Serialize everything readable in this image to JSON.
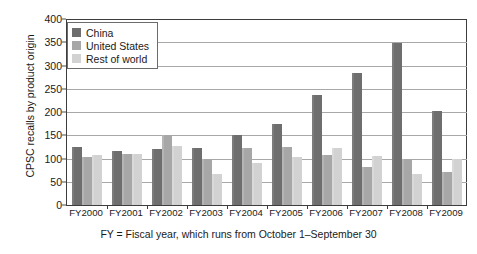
{
  "chart_data": {
    "type": "bar",
    "title": "",
    "subtitle": "",
    "xlabel": "",
    "ylabel": "CPSC recalls by product origin",
    "caption": "FY = Fiscal year, which runs from October 1–September 30",
    "categories": [
      "FY2000",
      "FY2001",
      "FY2002",
      "FY2003",
      "FY2004",
      "FY2005",
      "FY2006",
      "FY2007",
      "FY2008",
      "FY2009"
    ],
    "series": [
      {
        "name": "China",
        "color": "#6e6e6e",
        "values": [
          125,
          117,
          121,
          123,
          150,
          175,
          236,
          283,
          348,
          203
        ]
      },
      {
        "name": "United States",
        "color": "#a7a7a7",
        "values": [
          104,
          110,
          150,
          100,
          122,
          125,
          108,
          82,
          100,
          72
        ]
      },
      {
        "name": "Rest of world",
        "color": "#d2d2d2",
        "values": [
          108,
          110,
          126,
          66,
          90,
          104,
          123,
          105,
          67,
          100
        ]
      }
    ],
    "ylim": [
      0,
      400
    ],
    "ytick_values": [
      0,
      50,
      100,
      150,
      200,
      250,
      300,
      350,
      400
    ],
    "ytick_labels": [
      "0",
      "50",
      "100",
      "150",
      "200",
      "250",
      "300",
      "350",
      "400"
    ],
    "grid": true,
    "grid_axis": "y",
    "legend_position": "top-left",
    "legend_entries": [
      "China",
      "United States",
      "Rest of world"
    ],
    "bar_group_order": [
      "China",
      "United States",
      "Rest of world"
    ],
    "annotations": []
  }
}
